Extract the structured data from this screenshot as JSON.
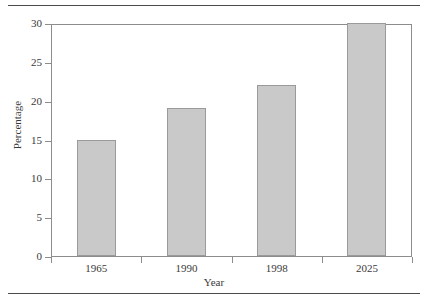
{
  "chart_data": {
    "type": "bar",
    "title": "",
    "categories": [
      "1965",
      "1990",
      "1998",
      "2025"
    ],
    "values": [
      15,
      19,
      22,
      30
    ],
    "xlabel": "Year",
    "ylabel": "Percentage",
    "ylim": [
      0,
      30
    ],
    "yticks": [
      0,
      5,
      10,
      15,
      20,
      25,
      30
    ],
    "ytick_labels": [
      "0",
      "5",
      "10",
      "15",
      "20",
      "25",
      "30"
    ],
    "grid": false,
    "legend": null,
    "colors": {
      "bar_fill": "#c9c9c9",
      "bar_border": "#9a9a9a",
      "axis": "#8d8d8d",
      "text": "#3a3a3a",
      "rule": "#4a4a4a",
      "background": "#ffffff"
    }
  }
}
